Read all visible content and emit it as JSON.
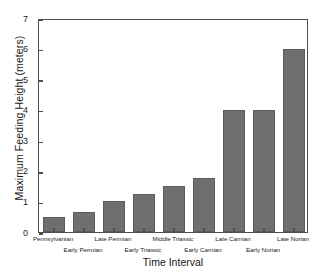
{
  "chart_data": {
    "type": "bar",
    "title": "",
    "xlabel": "Time Interval",
    "ylabel": "Maximum Feeding Height (meters)",
    "categories": [
      "Pennsylvanian",
      "Early Permian",
      "Late Permian",
      "Early Triassic",
      "Middle Triassic",
      "Early Carnian",
      "Late Carnian",
      "Early Norian",
      "Late Norian"
    ],
    "values": [
      0.5,
      0.65,
      1.0,
      1.25,
      1.5,
      1.78,
      4.0,
      4.0,
      6.0
    ],
    "ylim": [
      0,
      7
    ],
    "yticks": [
      0,
      1,
      2,
      3,
      4,
      5,
      6,
      7
    ],
    "ytick_labels": [
      "0",
      "1",
      "2",
      "3",
      "4",
      "5",
      "6",
      "7"
    ],
    "grid": false,
    "legend": null,
    "bar_color": "#6f6f6f",
    "bar_edge_color": "#5b5b5b",
    "axis_color": "#4f4f4f",
    "background_color": "#ffffff",
    "xtick_label_rows": [
      0,
      1,
      0,
      1,
      0,
      1,
      0,
      1,
      0
    ]
  }
}
